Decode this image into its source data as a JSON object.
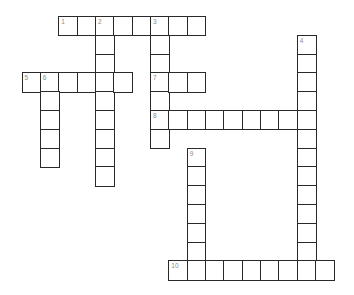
{
  "puzzle": {
    "type": "crossword",
    "grid": {
      "origin_x": 21.5,
      "origin_y": 16,
      "cell_w": 18.35,
      "cell_h": 18.8,
      "line_color": "#2a2a2a",
      "number_color": "#8a8a8a"
    },
    "entries": [
      {
        "number": "1",
        "direction": "across",
        "row": 0,
        "col": 2,
        "length": 8
      },
      {
        "number": "2",
        "direction": "down",
        "row": 0,
        "col": 4,
        "length": 9
      },
      {
        "number": "3",
        "direction": "down",
        "row": 0,
        "col": 7,
        "length": 7
      },
      {
        "number": "4",
        "direction": "down",
        "row": 1,
        "col": 15,
        "length": 13
      },
      {
        "number": "5",
        "direction": "across",
        "row": 3,
        "col": 0,
        "length": 6
      },
      {
        "number": "6",
        "direction": "down",
        "row": 3,
        "col": 1,
        "length": 5
      },
      {
        "number": "7",
        "direction": "across",
        "row": 3,
        "col": 7,
        "length": 3
      },
      {
        "number": "8",
        "direction": "across",
        "row": 5,
        "col": 7,
        "length": 9
      },
      {
        "number": "9",
        "direction": "down",
        "row": 7,
        "col": 9,
        "length": 7
      },
      {
        "number": "10",
        "direction": "across",
        "row": 13,
        "col": 8,
        "length": 9
      }
    ]
  }
}
